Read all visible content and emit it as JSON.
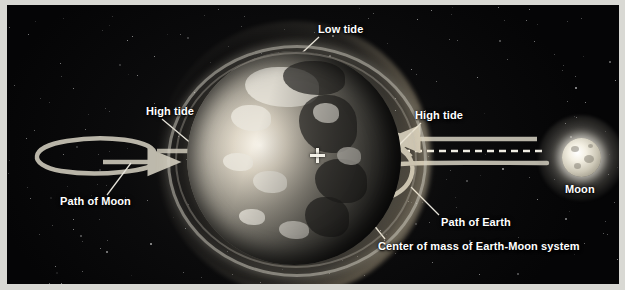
{
  "figure": {
    "background_color": "#050506",
    "frame_color": "#d9d9d4",
    "label_color": "#ffffff",
    "arrow_color": "#b9b5a8"
  },
  "labels": {
    "low_tide": "Low tide",
    "high_tide_left": "High tide",
    "high_tide_right": "High tide",
    "path_of_moon": "Path of Moon",
    "path_of_earth": "Path of Earth",
    "center_of_mass": "Center of mass of Earth-Moon system",
    "moon": "Moon"
  },
  "bodies": {
    "earth": {
      "name": "Earth",
      "center_x": 287,
      "center_y": 153,
      "radius": 107
    },
    "moon": {
      "name": "Moon",
      "center_x": 574,
      "center_y": 153,
      "radius": 20
    }
  },
  "markers": {
    "center_of_mass": {
      "symbol": "cross",
      "x": 310,
      "y": 150
    }
  },
  "paths": {
    "moon_orbit": {
      "description": "elliptical loop at left with rightward arrowhead"
    },
    "earth_orbit": {
      "description": "small curved loop right of Earth with arrowhead"
    },
    "earth_moon_axis": {
      "description": "dashed line connecting Earth center of mass to Moon"
    },
    "moon_direction_arrow": {
      "description": "solid arrow pointing left from Moon toward Earth"
    }
  }
}
